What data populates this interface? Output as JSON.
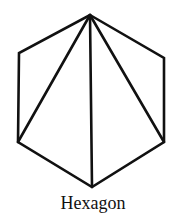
{
  "diagram": {
    "title": "Hexagon",
    "stroke_color": "#111111",
    "stroke_width": 2.6,
    "vertices": [
      {
        "id": "top",
        "x": 90,
        "y": 15
      },
      {
        "id": "upper-right",
        "x": 164,
        "y": 58
      },
      {
        "id": "lower-right",
        "x": 164,
        "y": 142
      },
      {
        "id": "bottom",
        "x": 92,
        "y": 187
      },
      {
        "id": "lower-left",
        "x": 18,
        "y": 142
      },
      {
        "id": "upper-left",
        "x": 19,
        "y": 53
      }
    ],
    "diagonals": [
      {
        "from": "top",
        "to": "lower-left"
      },
      {
        "from": "top",
        "to": "bottom"
      },
      {
        "from": "top",
        "to": "lower-right"
      }
    ]
  }
}
